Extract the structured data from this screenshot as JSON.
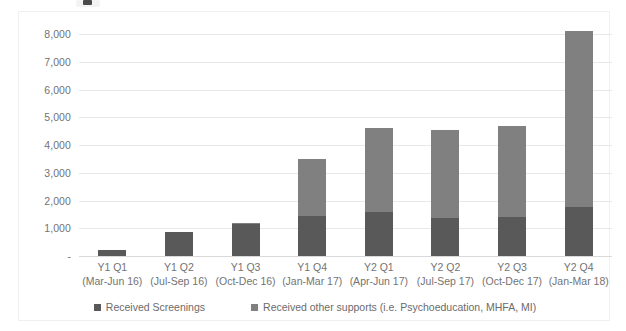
{
  "chart_data": {
    "type": "bar",
    "subtype": "stacked-column",
    "title": "",
    "xlabel": "",
    "ylabel": "",
    "ylim": [
      0,
      8000
    ],
    "ytick_labels": [
      "8,000",
      "7,000",
      "6,000",
      "5,000",
      "4,000",
      "3,000",
      "2,000",
      "1,000",
      "-"
    ],
    "ytick_values": [
      8000,
      7000,
      6000,
      5000,
      4000,
      3000,
      2000,
      1000,
      0
    ],
    "grid": true,
    "legend_position": "bottom",
    "categories": [
      "Y1 Q1",
      "Y1 Q2",
      "Y1 Q3",
      "Y1 Q4",
      "Y2 Q1",
      "Y2 Q2",
      "Y2 Q3",
      "Y2 Q4"
    ],
    "category_sublabels": [
      "(Mar-Jun 16)",
      "(Jul-Sep 16)",
      "(Oct-Dec 16)",
      "(Jan-Mar 17)",
      "(Apr-Jun 17)",
      "(Jul-Sep 17)",
      "(Oct-Dec 17)",
      "(Jan-Mar 18)"
    ],
    "series": [
      {
        "name": "Received Screenings",
        "color": "#595959",
        "values": [
          230,
          880,
          1150,
          1450,
          1600,
          1370,
          1400,
          1750
        ]
      },
      {
        "name": "Received other supports (i.e. Psychoeducation, MHFA, MI)",
        "color": "#808080",
        "values": [
          0,
          0,
          30,
          2050,
          3000,
          3160,
          3300,
          6350
        ]
      }
    ],
    "totals": [
      230,
      880,
      1180,
      3500,
      4600,
      4530,
      4700,
      8100
    ]
  },
  "legend": {
    "items": [
      {
        "label": "Received Screenings",
        "color": "#595959"
      },
      {
        "label": "Received other supports (i.e. Psychoeducation, MHFA, MI)",
        "color": "#808080"
      }
    ]
  }
}
